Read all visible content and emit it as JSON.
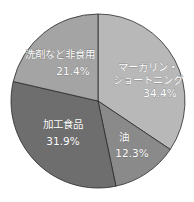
{
  "chart_data": {
    "type": "pie",
    "title": "",
    "start_angle_deg": 0,
    "direction": "clockwise",
    "center": [
      98,
      101
    ],
    "radius": 87,
    "slices": [
      {
        "label": "マーガリン・ショートニング",
        "label_lines": [
          "マーガリン・",
          "ショートニング"
        ],
        "value": 34.4,
        "display": "34.4%",
        "color": "#b8b8b8",
        "label_pos": [
          148,
          71
        ],
        "value_pos": [
          160,
          97
        ]
      },
      {
        "label": "油",
        "label_lines": [
          "油"
        ],
        "value": 12.3,
        "display": "12.3%",
        "color": "#8a8a8a",
        "label_pos": [
          124,
          141
        ],
        "value_pos": [
          132,
          157
        ]
      },
      {
        "label": "加工食品",
        "label_lines": [
          "加工食品"
        ],
        "value": 31.9,
        "display": "31.9%",
        "color": "#6e6e6e",
        "label_pos": [
          63,
          128
        ],
        "value_pos": [
          63,
          145
        ]
      },
      {
        "label": "洗剤など非食用",
        "label_lines": [
          "洗剤など非食用"
        ],
        "value": 21.4,
        "display": "21.4%",
        "color": "#a4a4a4",
        "label_pos": [
          60,
          58
        ],
        "value_pos": [
          73,
          75
        ]
      }
    ],
    "legend": "none"
  }
}
